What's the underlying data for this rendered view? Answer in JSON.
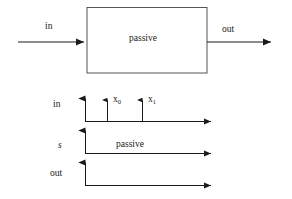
{
  "figure": {
    "background_color": "#ffffff",
    "stroke_color": "#1a1a1a",
    "text_color": "#1a1a1a"
  },
  "block_diagram": {
    "input_label": "in",
    "block_label": "passive",
    "output_label": "out"
  },
  "timing_diagram": {
    "rows": [
      {
        "axis_label": "in",
        "annotation": "",
        "ticks": [
          "x",
          "x"
        ]
      },
      {
        "axis_label": "s",
        "annotation": "passive",
        "ticks": []
      },
      {
        "axis_label": "out",
        "annotation": "",
        "ticks": []
      }
    ],
    "tick_labels": [
      {
        "base": "x",
        "sub": "0"
      },
      {
        "base": "x",
        "sub": "1"
      }
    ]
  }
}
